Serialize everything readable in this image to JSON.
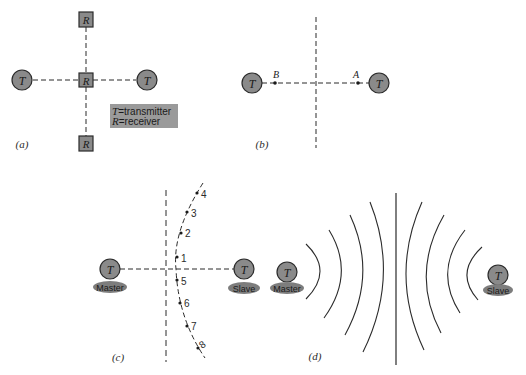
{
  "colors": {
    "ink": "#2b2b2b",
    "node_fill": "#8a8a8a",
    "legend_fill": "#9a9a9a",
    "label_ellipse": "#7d7d7d",
    "background": "#ffffff"
  },
  "panel_a": {
    "label": "(a)",
    "transmitter_symbol": "T",
    "receiver_symbol": "R",
    "legend": {
      "line1_symbol": "T",
      "line1_text": "=transmitter",
      "line2_symbol": "R",
      "line2_text": "=receiver"
    }
  },
  "panel_b": {
    "label": "(b)",
    "transmitter_symbol": "T",
    "point_left": "B",
    "point_right": "A"
  },
  "panel_c": {
    "label": "(c)",
    "transmitter_symbol": "T",
    "left_station": "Master",
    "right_station": "Slave",
    "curve_points": [
      "4",
      "3",
      "2",
      "1",
      "5",
      "6",
      "7",
      "8"
    ]
  },
  "panel_d": {
    "label": "(d)",
    "transmitter_symbol": "T",
    "left_station": "Master",
    "right_station": "Slave"
  }
}
